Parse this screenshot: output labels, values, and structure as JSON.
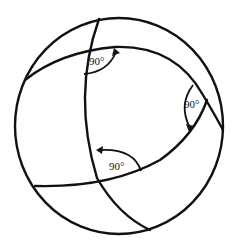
{
  "diagram": {
    "type": "spherical-triangle",
    "angles": [
      {
        "id": "top",
        "label": "90°"
      },
      {
        "id": "right",
        "label": "90°"
      },
      {
        "id": "bottom",
        "label": "90°"
      }
    ],
    "colors": {
      "stroke": "#111111",
      "background": "#ffffff"
    }
  }
}
